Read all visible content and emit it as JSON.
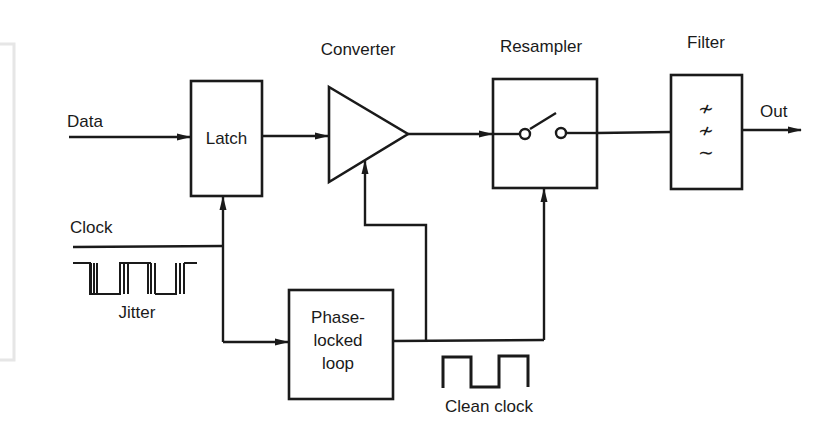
{
  "diagram": {
    "type": "block-diagram",
    "blocks": {
      "latch": {
        "label": "Latch"
      },
      "converter": {
        "label": "Converter"
      },
      "resampler": {
        "label": "Resampler"
      },
      "filter": {
        "label": "Filter",
        "symbols": [
          "≁",
          "≁",
          "∼"
        ]
      },
      "pll": {
        "label_lines": [
          "Phase-",
          "locked",
          "loop"
        ]
      }
    },
    "signals": {
      "data": "Data",
      "clock": "Clock",
      "out": "Out",
      "jitter": "Jitter",
      "clean_clock": "Clean clock"
    },
    "connections": [
      {
        "from": "Data",
        "to": "Latch"
      },
      {
        "from": "Latch",
        "to": "Converter"
      },
      {
        "from": "Converter",
        "to": "Resampler"
      },
      {
        "from": "Resampler",
        "to": "Filter"
      },
      {
        "from": "Filter",
        "to": "Out"
      },
      {
        "from": "Clock",
        "to": "Latch"
      },
      {
        "from": "Clock",
        "to": "Phase-locked loop"
      },
      {
        "from": "Phase-locked loop",
        "to": "Converter"
      },
      {
        "from": "Phase-locked loop",
        "to": "Resampler"
      }
    ],
    "colors": {
      "ink": "#1a1a1a",
      "background": "#ffffff",
      "page_edge": "#e6e6e6"
    }
  }
}
